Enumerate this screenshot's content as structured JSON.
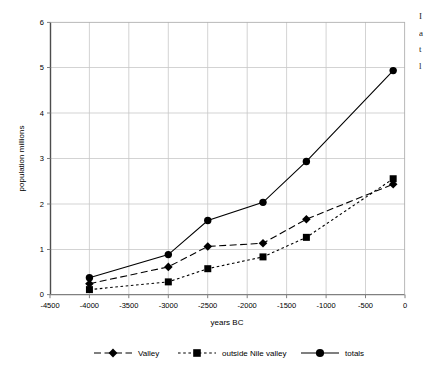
{
  "chart_data": {
    "type": "line",
    "title": "",
    "xlabel": "years BC",
    "ylabel": "population millions",
    "xlim": [
      -4500,
      0
    ],
    "ylim": [
      0,
      6
    ],
    "xticks": [
      -4500,
      -4000,
      -3500,
      -3000,
      -2500,
      -2000,
      -1500,
      -1000,
      -500,
      0
    ],
    "xtick_labels": [
      "-4500",
      "-4000",
      "-3500",
      "-3000",
      "-2500",
      "-2000",
      "-1500",
      "-1000",
      "-500",
      "0"
    ],
    "yticks": [
      0,
      1,
      2,
      3,
      4,
      5,
      6
    ],
    "ytick_labels": [
      "0",
      "1",
      "2",
      "3",
      "4",
      "5",
      "6"
    ],
    "grid": true,
    "grid_color": "#c8c8c8",
    "legend_position": "bottom",
    "x": [
      -4000,
      -3000,
      -2500,
      -1800,
      -1250,
      -150
    ],
    "series": [
      {
        "name": "Valley",
        "marker": "diamond",
        "dash": "long-dash",
        "color": "#000000",
        "values": [
          0.24,
          0.61,
          1.06,
          1.13,
          1.66,
          2.43
        ]
      },
      {
        "name": "outside Nile valley",
        "marker": "square",
        "dash": "short-dash",
        "color": "#000000",
        "values": [
          0.11,
          0.28,
          0.57,
          0.83,
          1.26,
          2.55
        ]
      },
      {
        "name": "totals",
        "marker": "circle",
        "dash": "solid",
        "color": "#000000",
        "values": [
          0.37,
          0.88,
          1.63,
          2.03,
          2.93,
          4.93
        ]
      }
    ]
  },
  "legend": {
    "items": [
      {
        "label": "Valley"
      },
      {
        "label": "outside Nile valley"
      },
      {
        "label": "totals"
      }
    ]
  },
  "axes": {
    "x_title": "years BC",
    "y_title": "population millions"
  },
  "caption_column": {
    "lines": [
      "I",
      "a",
      "t",
      "l"
    ]
  }
}
